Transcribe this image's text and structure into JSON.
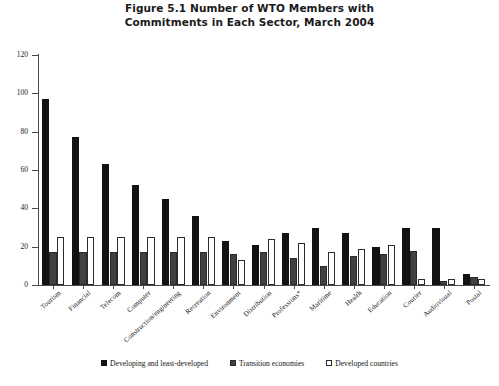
{
  "chart_data": {
    "type": "bar",
    "title": "Figure 5.1  Number of WTO Members with Commitments in Each Sector, March 2004",
    "title_lines": [
      "Figure 5.1  Number of WTO Members with",
      "Commitments in Each Sector, March 2004"
    ],
    "xlabel": "",
    "ylabel": "",
    "ylim": [
      0,
      120
    ],
    "yticks": [
      0,
      20,
      40,
      60,
      80,
      100,
      120
    ],
    "grid": false,
    "legend_position": "bottom",
    "categories": [
      "Tourism",
      "Financial",
      "Telecom",
      "Computer",
      "Construction/engineering",
      "Recreation",
      "Environment",
      "Distribution",
      "Professions*",
      "Maritime",
      "Health",
      "Education",
      "Courier",
      "Audiovisual",
      "Postal"
    ],
    "series": [
      {
        "name": "Developing and least-developed",
        "color": "#121212",
        "pattern": "solid",
        "values": [
          97,
          77,
          63,
          52,
          45,
          36,
          23,
          21,
          27,
          30,
          27,
          20,
          30,
          30,
          6
        ]
      },
      {
        "name": "Transition economies",
        "color": "#ffffff",
        "pattern": "dotted",
        "values": [
          17,
          17,
          17,
          17,
          17,
          17,
          16,
          17,
          14,
          10,
          15,
          16,
          18,
          2,
          4
        ]
      },
      {
        "name": "Developed countries",
        "color": "#ffffff",
        "pattern": "outline",
        "values": [
          25,
          25,
          25,
          25,
          25,
          25,
          13,
          24,
          22,
          17,
          19,
          21,
          3,
          3,
          3
        ]
      }
    ]
  },
  "legend": {
    "items": [
      {
        "label": "Developing and least-developed",
        "swatch": "solid-black-square"
      },
      {
        "label": "Transition economies",
        "swatch": "dotted-square"
      },
      {
        "label": "Developed countries",
        "swatch": "outline-square"
      }
    ]
  }
}
